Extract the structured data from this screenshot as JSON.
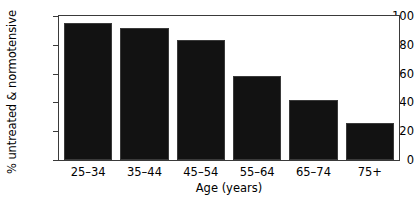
{
  "chart_data": {
    "type": "bar",
    "title": "",
    "xlabel": "Age (years)",
    "ylabel": "% untreated & normotensive",
    "categories": [
      "25–34",
      "35–44",
      "45–54",
      "55–64",
      "65–74",
      "75+"
    ],
    "values": [
      95,
      91.5,
      83,
      58,
      42,
      26
    ],
    "ylim": [
      0,
      100
    ],
    "yticks": [
      0,
      20,
      40,
      60,
      80,
      100
    ],
    "ytick_labels": [
      "0",
      "20",
      "40",
      "60",
      "80",
      "100"
    ],
    "grid": false,
    "legend": null,
    "bar_color": "#121212",
    "axis_color": "#3a3a3a",
    "background_color": "#ffffff"
  }
}
